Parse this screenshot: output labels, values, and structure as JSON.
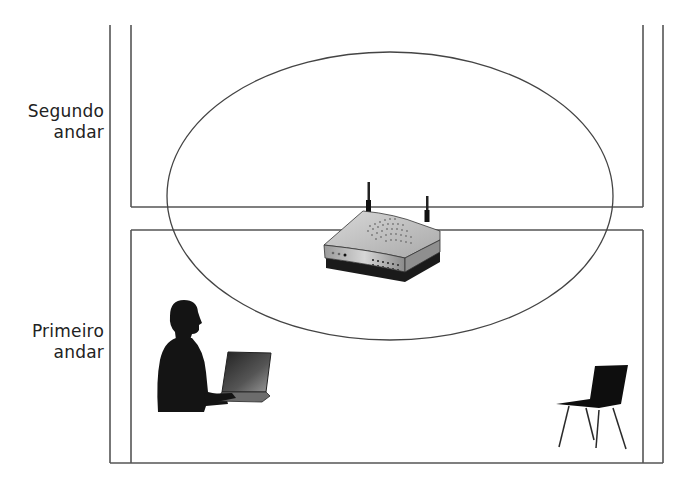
{
  "diagram": {
    "type": "wifi-coverage-across-floors",
    "floors": [
      {
        "id": "second",
        "label_line1": "Segundo",
        "label_line2": "andar"
      },
      {
        "id": "first",
        "label_line1": "Primeiro",
        "label_line2": "andar"
      }
    ],
    "elements": [
      {
        "name": "wireless-router",
        "description": "Roteador sem fio com duas antenas, posicionado no piso entre os andares"
      },
      {
        "name": "coverage-ellipse",
        "description": "Área de cobertura do sinal sem fio"
      },
      {
        "name": "person-with-laptop",
        "description": "Pessoa segurando um notebook no primeiro andar"
      },
      {
        "name": "chair",
        "description": "Cadeira no primeiro andar"
      }
    ],
    "colors": {
      "line": "#555555",
      "silhouette": "#111111",
      "router_body": "#bdbdbd"
    }
  }
}
